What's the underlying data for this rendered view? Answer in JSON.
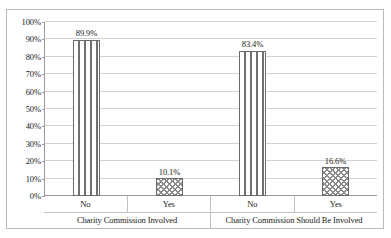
{
  "chart_data": {
    "type": "bar",
    "title": "",
    "subtitle": "",
    "xlabel": "",
    "ylabel": "",
    "ylim": [
      0,
      100
    ],
    "grid": true,
    "legend": false,
    "grouped": true,
    "y_ticks": [
      "0%",
      "10%",
      "20%",
      "30%",
      "40%",
      "50%",
      "60%",
      "70%",
      "80%",
      "90%",
      "100%"
    ],
    "y_tick_values": [
      0,
      10,
      20,
      30,
      40,
      50,
      60,
      70,
      80,
      90,
      100
    ],
    "categories": [
      "No",
      "Yes"
    ],
    "groups": [
      {
        "label": "Charity Commission Involved",
        "bars": [
          {
            "category": "No",
            "value": 89.9,
            "data_label": "89.9%",
            "fill": "vertical-stripes"
          },
          {
            "category": "Yes",
            "value": 10.1,
            "data_label": "10.1%",
            "fill": "checkered-dots"
          }
        ]
      },
      {
        "label": "Charity Commission Should Be Involved",
        "bars": [
          {
            "category": "No",
            "value": 83.4,
            "data_label": "83.4%",
            "fill": "vertical-stripes"
          },
          {
            "category": "Yes",
            "value": 16.6,
            "data_label": "16.6%",
            "fill": "checkered-dots"
          }
        ]
      }
    ],
    "series": [
      {
        "name": "No",
        "values": [
          89.9,
          83.4
        ]
      },
      {
        "name": "Yes",
        "values": [
          10.1,
          16.6
        ]
      }
    ],
    "colors": {
      "bar_outline": "#6b6b6b",
      "bar_fill_background": "#ffffff",
      "pattern_stroke": "#707070",
      "gridline": "#d2d2d2",
      "axis_line": "#9a9a9a",
      "frame_border": "#b9b9b9",
      "text": "#1a1a1a",
      "plot_background": "#ffffff"
    }
  }
}
